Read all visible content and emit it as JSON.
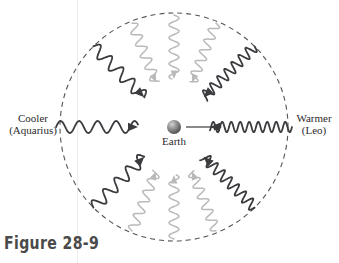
{
  "figure": {
    "caption": "Figure 28-9",
    "center_body_label": "Earth",
    "labels": {
      "left_primary": "Cooler",
      "left_secondary": "(Aquarius)",
      "right_primary": "Warmer",
      "right_secondary": "(Leo)"
    }
  },
  "colors": {
    "background": "#ffffff",
    "dark_wave": "#3b3b3f",
    "light_wave": "#b9b9b9",
    "dashed_circle": "#555555",
    "text": "#2b2b2b",
    "caption_text": "#4a4a4a",
    "earth_light": "#c9c9c9",
    "earth_mid": "#8e8e8e",
    "earth_dark": "#5a5a5a",
    "scanline": "#edede d"
  },
  "geometry": {
    "circle_center_x": 174,
    "circle_center_y": 127,
    "circle_radius": 114,
    "earth_radius": 7,
    "dash_pattern": "5,4"
  },
  "motion_arrow": {
    "name": "earth-motion-arrow",
    "from_x": 186,
    "to_x": 222,
    "y": 127
  },
  "waves": [
    {
      "id": "wave-left",
      "direction_label": "cooler",
      "tone": "dark",
      "angle_deg": 180,
      "wavelength": 18.5,
      "amplitude": 6.0,
      "start_radius": 118,
      "end_radius": 36
    },
    {
      "id": "wave-upper-left",
      "direction_label": "cooler",
      "tone": "dark",
      "angle_deg": 135,
      "wavelength": 16.0,
      "amplitude": 6.0,
      "start_radius": 114,
      "end_radius": 42
    },
    {
      "id": "wave-lower-left",
      "direction_label": "cooler",
      "tone": "dark",
      "angle_deg": 225,
      "wavelength": 16.0,
      "amplitude": 6.0,
      "start_radius": 114,
      "end_radius": 42
    },
    {
      "id": "wave-right",
      "direction_label": "warmer",
      "tone": "dark",
      "angle_deg": 0,
      "wavelength": 9.0,
      "amplitude": 5.2,
      "start_radius": 118,
      "end_radius": 36
    },
    {
      "id": "wave-upper-right",
      "direction_label": "warmer",
      "tone": "dark",
      "angle_deg": 45,
      "wavelength": 10.0,
      "amplitude": 5.4,
      "start_radius": 114,
      "end_radius": 42
    },
    {
      "id": "wave-lower-right",
      "direction_label": "warmer",
      "tone": "dark",
      "angle_deg": 315,
      "wavelength": 10.0,
      "amplitude": 5.4,
      "start_radius": 114,
      "end_radius": 42
    },
    {
      "id": "wave-top-left",
      "direction_label": "neutral",
      "tone": "light",
      "angle_deg": 112,
      "wavelength": 12.5,
      "amplitude": 5.0,
      "start_radius": 112,
      "end_radius": 48
    },
    {
      "id": "wave-top-center",
      "direction_label": "neutral",
      "tone": "light",
      "angle_deg": 90,
      "wavelength": 13.0,
      "amplitude": 5.0,
      "start_radius": 112,
      "end_radius": 48
    },
    {
      "id": "wave-top-right",
      "direction_label": "neutral",
      "tone": "light",
      "angle_deg": 68,
      "wavelength": 11.5,
      "amplitude": 5.0,
      "start_radius": 112,
      "end_radius": 48
    },
    {
      "id": "wave-bottom-left",
      "direction_label": "neutral",
      "tone": "light",
      "angle_deg": 248,
      "wavelength": 12.5,
      "amplitude": 5.0,
      "start_radius": 112,
      "end_radius": 48
    },
    {
      "id": "wave-bottom-center",
      "direction_label": "neutral",
      "tone": "light",
      "angle_deg": 270,
      "wavelength": 13.0,
      "amplitude": 5.0,
      "start_radius": 112,
      "end_radius": 48
    },
    {
      "id": "wave-bottom-right",
      "direction_label": "neutral",
      "tone": "light",
      "angle_deg": 292,
      "wavelength": 11.5,
      "amplitude": 5.0,
      "start_radius": 112,
      "end_radius": 48
    }
  ]
}
